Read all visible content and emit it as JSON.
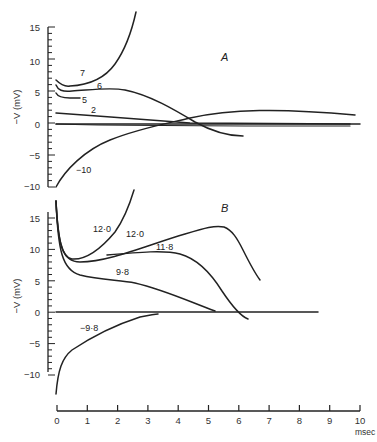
{
  "chart_data": [
    {
      "type": "line",
      "panel_label": "A",
      "ylabel": "−V (mV)",
      "ylim": [
        -10,
        15
      ],
      "yticks": [
        "15",
        "10",
        "5",
        "0",
        "−5",
        "−10"
      ],
      "xlim": [
        0,
        10
      ],
      "series": [
        {
          "name": "7",
          "x": [
            0,
            0.3,
            1,
            2,
            2.8,
            3.3,
            3.5
          ],
          "y": [
            7,
            6.2,
            6.5,
            8,
            10.5,
            14,
            17
          ]
        },
        {
          "name": "6",
          "x": [
            0,
            0.5,
            1,
            2.5,
            3.5,
            4.5,
            5.5,
            6.5,
            7.1
          ],
          "y": [
            6,
            5.3,
            5.3,
            5.5,
            4.8,
            2.5,
            0,
            -1.5,
            -1.6
          ]
        },
        {
          "name": "5",
          "x": [
            0,
            0.4,
            0.9
          ],
          "y": [
            5,
            4.4,
            4.3
          ]
        },
        {
          "name": "2",
          "x": [
            0,
            2,
            4,
            6,
            8,
            9.5
          ],
          "y": [
            1.8,
            1.2,
            0.5,
            0.1,
            0,
            0
          ]
        },
        {
          "name": "0 (baseline)",
          "x": [
            0,
            10
          ],
          "y": [
            0,
            0
          ]
        },
        {
          "name": "−10",
          "x": [
            0,
            0.5,
            1.5,
            3,
            4,
            5,
            6.5,
            8,
            9.5
          ],
          "y": [
            -10,
            -7,
            -4,
            -1.8,
            0,
            1.2,
            2,
            2.1,
            1.2
          ]
        }
      ],
      "labels": [
        "7",
        "6",
        "5",
        "2",
        "−10"
      ]
    },
    {
      "type": "line",
      "panel_label": "B",
      "ylabel": "−V (mV)",
      "ylim": [
        -12,
        17
      ],
      "yticks": [
        "15",
        "10",
        "5",
        "0",
        "−5",
        "−10"
      ],
      "xlabel": "msec",
      "xlim": [
        0,
        10
      ],
      "xticks": [
        "0",
        "1",
        "2",
        "3",
        "4",
        "5",
        "6",
        "7",
        "8",
        "9",
        "10"
      ],
      "series": [
        {
          "name": "12·0 (upper)",
          "x": [
            0,
            0.3,
            0.5,
            1,
            1.8,
            2.4,
            2.6
          ],
          "y": [
            17,
            10,
            8.5,
            9.5,
            12.5,
            16,
            19
          ]
        },
        {
          "name": "12·0",
          "x": [
            0,
            0.3,
            0.6,
            1.5,
            2.5,
            3.5,
            4.5,
            5,
            5.5,
            6
          ],
          "y": [
            17,
            9.5,
            8,
            8.5,
            10.5,
            13,
            14.2,
            14,
            10,
            5
          ]
        },
        {
          "name": "11·8",
          "x": [
            1.5,
            2.5,
            3.5,
            4.2,
            5,
            5.8,
            6.1
          ],
          "y": [
            9.5,
            9.6,
            9.4,
            8,
            4,
            0,
            -0.8
          ]
        },
        {
          "name": "9·8",
          "x": [
            0,
            0.3,
            0.7,
            1.5,
            2.5,
            3.5,
            4.5,
            5.3
          ],
          "y": [
            17,
            8,
            6.2,
            5.8,
            5,
            3,
            1,
            0
          ]
        },
        {
          "name": "0 (baseline)",
          "x": [
            0,
            8.6
          ],
          "y": [
            0,
            0
          ]
        },
        {
          "name": "−9·8",
          "x": [
            0,
            0.3,
            1,
            2,
            3.3
          ],
          "y": [
            -13,
            -7.5,
            -4.5,
            -2.5,
            -0.6
          ]
        }
      ],
      "labels": [
        "12·0",
        "12·0",
        "11·8",
        "9·8",
        "−9·8"
      ]
    }
  ]
}
